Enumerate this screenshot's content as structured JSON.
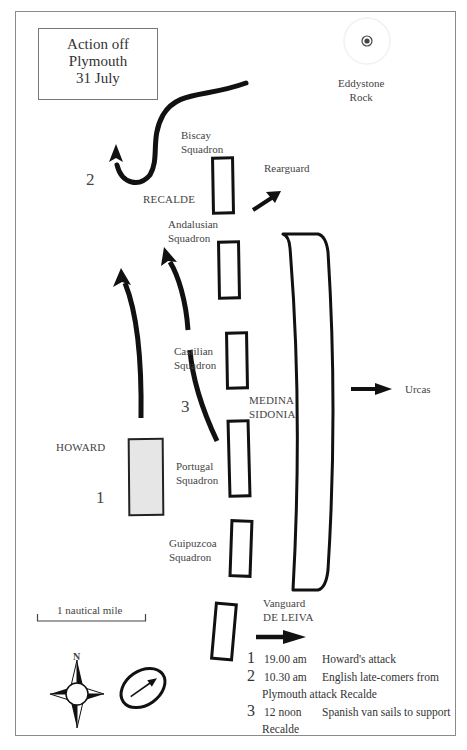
{
  "title": {
    "line1": "Action off",
    "line2": "Plymouth",
    "line3": "31 July"
  },
  "landmark": {
    "name_line1": "Eddystone",
    "name_line2": "Rock",
    "icon": "target-icon"
  },
  "labels": {
    "biscay_l1": "Biscay",
    "biscay_l2": "Squadron",
    "recalde": "RECALDE",
    "rearguard": "Rearguard",
    "andalusian_l1": "Andalusian",
    "andalusian_l2": "Squadron",
    "castilian_l1": "Castilian",
    "castilian_l2": "Squadron",
    "medina_l1": "MEDINA",
    "medina_l2": "SIDONIA",
    "urcas": "Urcas",
    "howard": "HOWARD",
    "portugal_l1": "Portugal",
    "portugal_l2": "Squadron",
    "guipuzcoa_l1": "Guipuzcoa",
    "guipuzcoa_l2": "Squadron",
    "vanguard": "Vanguard",
    "de_leiva": "DE LEIVA"
  },
  "markers": {
    "m1": "1",
    "m2": "2",
    "m3": "3"
  },
  "scale": {
    "label": "1 nautical mile"
  },
  "compass": {
    "north": "N",
    "rose_icon": "compass-rose-icon",
    "wind_icon": "wind-direction-icon"
  },
  "legend": [
    {
      "num": "1",
      "time": "19.00 am",
      "text": "Howard's attack"
    },
    {
      "num": "2",
      "time": "10.30 am",
      "text": "English late-comers from",
      "text2": "Plymouth attack Recalde"
    },
    {
      "num": "3",
      "time": "12 noon",
      "text": "Spanish van sails to support",
      "text2": "Recalde"
    }
  ]
}
